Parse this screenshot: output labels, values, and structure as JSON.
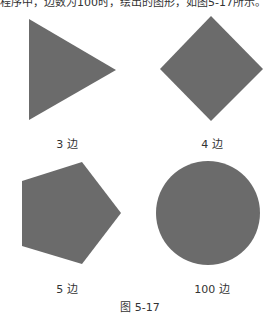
{
  "top_text_cut": "程序中，边数为100时，绘出的图形，如图5-17所示。",
  "shape_color": "#6b6b6b",
  "shapes": [
    {
      "label": "3 边",
      "sides": 3
    },
    {
      "label": "4 边",
      "sides": 4
    },
    {
      "label": "5 边",
      "sides": 5
    },
    {
      "label": "100 边",
      "sides": 100
    }
  ],
  "caption": "图 5-17"
}
